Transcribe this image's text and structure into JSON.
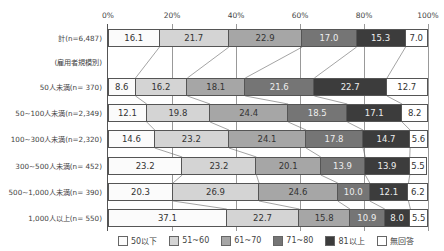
{
  "chart_data": {
    "type": "bar",
    "orientation": "horizontal",
    "stacked": true,
    "percent": true,
    "xlim": [
      0,
      100
    ],
    "x_ticks": [
      "0%",
      "20%",
      "40%",
      "60%",
      "80%",
      "100%"
    ],
    "group_label": "(雇用者規模別)",
    "categories": [
      "計(n=6,487)",
      "50人未満(n= 370)",
      "50~100人未満(n=2,349)",
      "100~300人未満(n=2,320)",
      "300~500人未満(n= 452)",
      "500~1,000人未満(n= 390)",
      "1,000人以上(n= 550)"
    ],
    "series": [
      {
        "name": "50以下",
        "values": [
          16.1,
          8.6,
          12.1,
          14.6,
          23.2,
          20.3,
          37.1
        ]
      },
      {
        "name": "51~60",
        "values": [
          21.7,
          16.2,
          19.8,
          23.2,
          23.2,
          26.9,
          22.7
        ]
      },
      {
        "name": "61~70",
        "values": [
          22.9,
          18.1,
          24.4,
          24.1,
          20.1,
          24.6,
          15.8
        ]
      },
      {
        "name": "71~80",
        "values": [
          17.0,
          21.6,
          18.5,
          17.8,
          13.9,
          10.0,
          10.9
        ]
      },
      {
        "name": "81以上",
        "values": [
          15.3,
          22.7,
          17.1,
          14.7,
          13.9,
          12.1,
          8.0
        ]
      },
      {
        "name": "無回答",
        "values": [
          7.0,
          12.7,
          8.2,
          5.6,
          5.5,
          6.2,
          5.5
        ]
      }
    ],
    "legend_position": "bottom",
    "grid": true,
    "title": "",
    "xlabel": "",
    "ylabel": ""
  }
}
